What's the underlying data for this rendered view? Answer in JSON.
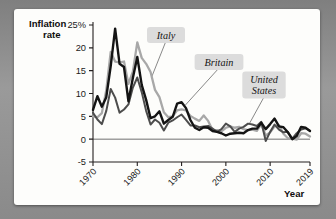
{
  "figure": {
    "background_color": "#8e8e8e",
    "card_color": "#fdfdfb"
  },
  "chart_data": {
    "type": "line",
    "title": "",
    "xlabel": "Year",
    "ylabel": "Inflation rate",
    "ylabel_line1": "Inflation",
    "ylabel_line2": "rate",
    "xlim": [
      1970,
      2019
    ],
    "ylim": [
      -5,
      25
    ],
    "grid": false,
    "legend": "annotated-callouts",
    "ytick_labels": [
      "25%",
      "20",
      "15",
      "10",
      "5",
      "0",
      "-5"
    ],
    "ytick_values": [
      25,
      20,
      15,
      10,
      5,
      0,
      -5
    ],
    "xtick_labels": [
      "1970",
      "1980",
      "1990",
      "2000",
      "2010",
      "2019"
    ],
    "xtick_values": [
      1970,
      1980,
      1990,
      2000,
      2010,
      2019
    ],
    "x": [
      1970,
      1971,
      1972,
      1973,
      1974,
      1975,
      1976,
      1977,
      1978,
      1979,
      1980,
      1981,
      1982,
      1983,
      1984,
      1985,
      1986,
      1987,
      1988,
      1989,
      1990,
      1991,
      1992,
      1993,
      1994,
      1995,
      1996,
      1997,
      1998,
      1999,
      2000,
      2001,
      2002,
      2003,
      2004,
      2005,
      2006,
      2007,
      2008,
      2009,
      2010,
      2011,
      2012,
      2013,
      2014,
      2015,
      2016,
      2017,
      2018,
      2019
    ],
    "series": [
      {
        "name": "Britain",
        "color": "#141414",
        "width": 2.4,
        "values": [
          6.4,
          9.4,
          7.1,
          9.2,
          16.0,
          24.2,
          16.5,
          15.8,
          8.3,
          13.4,
          18.0,
          11.9,
          8.6,
          4.6,
          5.0,
          6.1,
          3.4,
          4.2,
          4.9,
          7.8,
          8.1,
          6.8,
          4.2,
          2.5,
          2.0,
          2.6,
          2.5,
          1.8,
          1.6,
          1.3,
          0.8,
          1.2,
          1.3,
          1.4,
          1.3,
          2.0,
          2.3,
          2.3,
          3.6,
          2.2,
          3.3,
          4.5,
          2.8,
          2.6,
          1.5,
          0.0,
          0.7,
          2.7,
          2.5,
          1.8
        ]
      },
      {
        "name": "Italy",
        "color": "#a8a8a8",
        "width": 2.3,
        "values": [
          5.0,
          4.8,
          5.7,
          10.8,
          19.1,
          17.0,
          16.8,
          17.0,
          12.1,
          14.8,
          21.2,
          17.8,
          16.5,
          14.7,
          10.8,
          9.2,
          5.9,
          4.8,
          5.0,
          6.3,
          6.5,
          6.3,
          5.1,
          4.5,
          4.0,
          5.2,
          4.0,
          2.0,
          2.0,
          1.7,
          2.5,
          2.8,
          2.5,
          2.7,
          2.2,
          2.0,
          2.1,
          1.8,
          3.3,
          0.8,
          1.5,
          2.8,
          3.0,
          1.2,
          0.2,
          0.1,
          -0.1,
          1.3,
          1.2,
          0.6
        ]
      },
      {
        "name": "United States",
        "color": "#4d4d4d",
        "width": 2.0,
        "values": [
          5.8,
          4.3,
          3.3,
          6.2,
          11.0,
          9.1,
          5.8,
          6.5,
          7.6,
          11.3,
          13.5,
          10.3,
          6.2,
          3.2,
          4.3,
          3.6,
          1.9,
          3.6,
          4.1,
          4.8,
          5.4,
          4.2,
          3.0,
          3.0,
          2.6,
          2.8,
          2.9,
          2.3,
          1.6,
          2.2,
          3.4,
          2.8,
          1.6,
          2.3,
          2.7,
          3.4,
          3.2,
          2.9,
          3.8,
          -0.4,
          1.6,
          3.2,
          2.1,
          1.5,
          1.6,
          0.1,
          1.3,
          2.1,
          2.4,
          1.8
        ]
      }
    ],
    "annotations": [
      {
        "label": "Italy",
        "target_series": "Italy",
        "lines": [
          "Italy"
        ]
      },
      {
        "label": "Britain",
        "target_series": "Britain",
        "lines": [
          "Britain"
        ]
      },
      {
        "label": "United States",
        "target_series": "United States",
        "lines": [
          "United",
          "States"
        ]
      }
    ]
  }
}
